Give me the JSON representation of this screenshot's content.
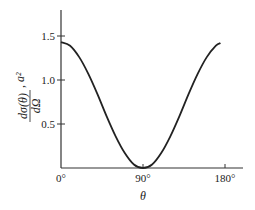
{
  "chart_data": {
    "type": "line",
    "title": "",
    "xlabel": "θ",
    "ylabel": "dσ(θ)/dΩ, a²",
    "ylabel_parts": {
      "numerator": "dσ(θ)",
      "denominator": "dΩ",
      "suffix": ", a²"
    },
    "xlim": [
      0,
      180
    ],
    "ylim": [
      0,
      1.75
    ],
    "grid": false,
    "legend": null,
    "x_ticks": [
      0,
      90,
      180
    ],
    "x_tick_labels": [
      "0°",
      "90°",
      "180°"
    ],
    "y_ticks": [
      0.5,
      1.0,
      1.5
    ],
    "y_tick_labels": [
      "0.5",
      "1.0",
      "1.5"
    ],
    "series": [
      {
        "name": "dσ/dΩ",
        "color": "#222222",
        "x": [
          0,
          10,
          20,
          30,
          40,
          50,
          60,
          70,
          80,
          90,
          100,
          110,
          120,
          130,
          140,
          150,
          160,
          170,
          175
        ],
        "y": [
          1.43,
          1.39,
          1.26,
          1.07,
          0.84,
          0.59,
          0.36,
          0.17,
          0.04,
          0.0,
          0.04,
          0.17,
          0.36,
          0.59,
          0.84,
          1.07,
          1.26,
          1.39,
          1.42
        ]
      }
    ]
  }
}
